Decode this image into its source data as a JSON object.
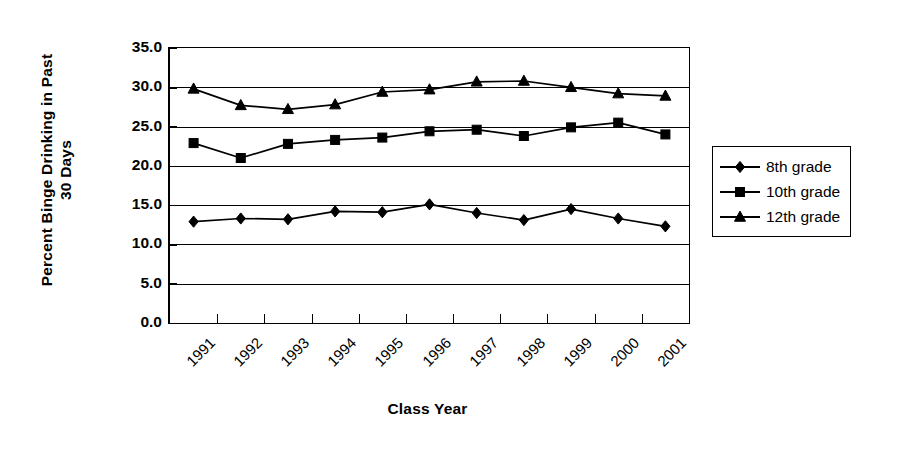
{
  "chart_data": {
    "type": "line",
    "title": "",
    "xlabel": "Class Year",
    "ylabel": "Percent Binge Drinking in Past 30 Days",
    "ylabel_lines": [
      "Percent Binge Drinking in Past",
      "30 Days"
    ],
    "categories": [
      "1991",
      "1992",
      "1993",
      "1994",
      "1995",
      "1996",
      "1997",
      "1998",
      "1999",
      "2000",
      "2001"
    ],
    "ytick_labels": [
      "35.0",
      "30.0",
      "25.0",
      "20.0",
      "15.0",
      "10.0",
      "5.0",
      "0.0"
    ],
    "ytick_values": [
      35.0,
      30.0,
      25.0,
      20.0,
      15.0,
      10.0,
      5.0,
      0.0
    ],
    "ylim": [
      0,
      35
    ],
    "grid": "horizontal",
    "legend_position": "right",
    "series": [
      {
        "name": "8th grade",
        "marker": "diamond",
        "color": "#000000",
        "values": [
          12.9,
          13.3,
          13.2,
          14.2,
          14.1,
          15.1,
          14.0,
          13.1,
          14.5,
          13.3,
          12.3
        ]
      },
      {
        "name": "10th grade",
        "marker": "square",
        "color": "#000000",
        "values": [
          22.9,
          21.0,
          22.8,
          23.3,
          23.6,
          24.4,
          24.6,
          23.8,
          24.9,
          25.5,
          24.0
        ]
      },
      {
        "name": "12th grade",
        "marker": "triangle",
        "color": "#000000",
        "values": [
          29.8,
          27.7,
          27.2,
          27.8,
          29.4,
          29.7,
          30.7,
          30.8,
          30.0,
          29.2,
          28.9
        ]
      }
    ]
  },
  "legend": {
    "items": [
      {
        "label": "8th grade",
        "marker": "diamond"
      },
      {
        "label": "10th grade",
        "marker": "square"
      },
      {
        "label": "12th grade",
        "marker": "triangle"
      }
    ]
  }
}
